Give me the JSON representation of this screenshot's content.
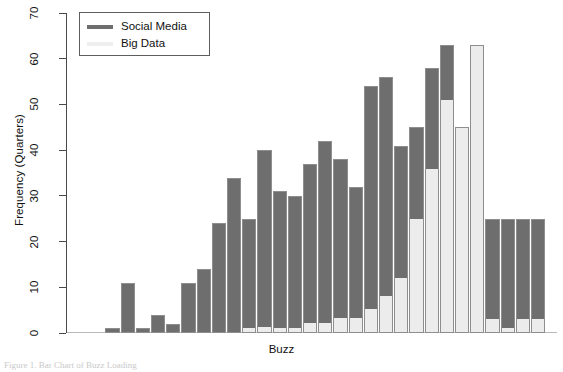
{
  "chart_data": {
    "type": "bar",
    "title": "",
    "subtitle": "",
    "xlabel": "Buzz",
    "ylabel": "Frequency (Quarters)",
    "stacked": true,
    "grid": false,
    "legend_position": "top-left",
    "ylim": [
      0,
      70
    ],
    "yticks": [
      0,
      10,
      20,
      30,
      40,
      50,
      60,
      70
    ],
    "ytick_labels": [
      "0",
      "10",
      "20",
      "30",
      "40",
      "50",
      "60",
      "70"
    ],
    "xticks": [],
    "xtick_labels": [],
    "categories": [
      "1",
      "2",
      "3",
      "4",
      "5",
      "6",
      "7",
      "8",
      "9",
      "10",
      "11",
      "12",
      "13",
      "14",
      "15",
      "16",
      "17",
      "18",
      "19",
      "20",
      "21",
      "22",
      "23",
      "24",
      "25",
      "26",
      "27",
      "28",
      "29",
      "30",
      "31",
      "32",
      "33",
      "34"
    ],
    "series": [
      {
        "name": "Social Media",
        "color": "#6e6e6e",
        "values": [
          0,
          0,
          1,
          11,
          1,
          4,
          2,
          11,
          14,
          24,
          34,
          24,
          40,
          31,
          30,
          37,
          42,
          38,
          32,
          54,
          56,
          41,
          51,
          58,
          63,
          12,
          0,
          0,
          0,
          0,
          23,
          25,
          22,
          22
        ]
      },
      {
        "name": "Big Data",
        "color": "#ececec",
        "values": [
          0,
          0,
          0,
          0,
          0,
          0,
          0,
          0,
          0,
          0,
          0,
          1,
          0,
          0,
          1,
          1,
          2,
          3,
          3,
          0,
          0,
          15,
          25,
          36,
          51,
          45,
          63,
          25,
          25,
          25,
          2,
          0,
          3,
          3
        ]
      }
    ],
    "totals": [
      0,
      0,
      1,
      11,
      1,
      4,
      2,
      11,
      14,
      24,
      34,
      25,
      40,
      31,
      31,
      38,
      44,
      41,
      35,
      54,
      56,
      56,
      76,
      94,
      114,
      57,
      63,
      25,
      25,
      25,
      25,
      25,
      25,
      25
    ],
    "bars": [
      {
        "total": 0,
        "big_data": 0
      },
      {
        "total": 0,
        "big_data": 0
      },
      {
        "total": 1,
        "big_data": 0
      },
      {
        "total": 11,
        "big_data": 0
      },
      {
        "total": 1,
        "big_data": 0
      },
      {
        "total": 4,
        "big_data": 0
      },
      {
        "total": 2,
        "big_data": 0
      },
      {
        "total": 11,
        "big_data": 0
      },
      {
        "total": 14,
        "big_data": 0
      },
      {
        "total": 24,
        "big_data": 0
      },
      {
        "total": 34,
        "big_data": 0
      },
      {
        "total": 25,
        "big_data": 1
      },
      {
        "total": 40,
        "big_data": 1
      },
      {
        "total": 31,
        "big_data": 1
      },
      {
        "total": 30,
        "big_data": 1
      },
      {
        "total": 37,
        "big_data": 2
      },
      {
        "total": 42,
        "big_data": 2
      },
      {
        "total": 38,
        "big_data": 3
      },
      {
        "total": 32,
        "big_data": 3
      },
      {
        "total": 54,
        "big_data": 5
      },
      {
        "total": 56,
        "big_data": 8
      },
      {
        "total": 41,
        "big_data": 12
      },
      {
        "total": 45,
        "big_data": 25
      },
      {
        "total": 58,
        "big_data": 36
      },
      {
        "total": 63,
        "big_data": 51
      },
      {
        "total": 45,
        "big_data": 45
      },
      {
        "total": 63,
        "big_data": 63
      },
      {
        "total": 25,
        "big_data": 3
      },
      {
        "total": 25,
        "big_data": 1
      },
      {
        "total": 25,
        "big_data": 3
      },
      {
        "total": 25,
        "big_data": 3
      }
    ]
  },
  "legend": {
    "entries": [
      {
        "label": "Social Media",
        "color": "#6e6e6e"
      },
      {
        "label": "Big Data",
        "color": "#efefef"
      }
    ]
  },
  "axes": {
    "y_title": "Frequency (Quarters)",
    "x_title": "Buzz"
  },
  "caption": {
    "text": "Figure 1.  Bar Chart of Buzz Loading"
  }
}
